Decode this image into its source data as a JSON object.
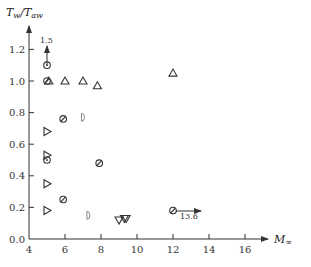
{
  "chart_data": {
    "type": "scatter",
    "title": "",
    "xlabel": "M∞",
    "ylabel": "Tw/Taw",
    "xlim": [
      4,
      17
    ],
    "ylim": [
      0.0,
      1.35
    ],
    "grid": false,
    "legend": null,
    "x_ticks": [
      4,
      6,
      8,
      10,
      12,
      14,
      16
    ],
    "y_ticks": [
      0.0,
      0.2,
      0.4,
      0.6,
      0.8,
      1.0,
      1.2
    ],
    "x_tick_labels": [
      "4",
      "6",
      "8",
      "10",
      "12",
      "14",
      "16"
    ],
    "y_tick_labels": [
      "0.0",
      "0.2",
      "0.4",
      "0.6",
      "0.8",
      "1.0",
      "1.2"
    ],
    "series": [
      {
        "name": "open-circle-dot",
        "marker": "circle-dot",
        "points": [
          [
            5.0,
            1.1
          ],
          [
            5.0,
            0.5
          ]
        ]
      },
      {
        "name": "slashed-circle",
        "marker": "circle-slash",
        "points": [
          [
            5.0,
            1.0
          ],
          [
            5.9,
            0.76
          ],
          [
            7.9,
            0.48
          ],
          [
            5.9,
            0.25
          ],
          [
            12.0,
            0.18
          ]
        ]
      },
      {
        "name": "up-triangle",
        "marker": "triangle-up",
        "points": [
          [
            5.1,
            1.0
          ],
          [
            6.0,
            1.0
          ],
          [
            7.0,
            1.0
          ],
          [
            7.8,
            0.97
          ],
          [
            12.0,
            1.05
          ]
        ]
      },
      {
        "name": "right-triangle",
        "marker": "triangle-right",
        "points": [
          [
            5.0,
            0.68
          ],
          [
            5.0,
            0.53
          ],
          [
            5.0,
            0.35
          ],
          [
            5.0,
            0.18
          ]
        ]
      },
      {
        "name": "half-circle",
        "marker": "d-shape",
        "points": [
          [
            7.0,
            0.77
          ],
          [
            7.3,
            0.15
          ]
        ]
      },
      {
        "name": "down-triangle",
        "marker": "triangle-down",
        "points": [
          [
            9.0,
            0.12
          ],
          [
            9.3,
            0.13
          ],
          [
            9.4,
            0.13
          ]
        ]
      }
    ],
    "annotations": [
      {
        "text": "1.5",
        "at": [
          5.0,
          1.1
        ],
        "note": "upward arrow: point off scale at 1.5"
      },
      {
        "text": "13.6",
        "at": [
          12.0,
          0.18
        ],
        "note": "rightward arrow: range extends to M=13.6"
      }
    ]
  },
  "labels": {
    "ylabel_main": "T",
    "ylabel_sub1": "w",
    "ylabel_slash": "/T",
    "ylabel_sub2": "aw",
    "xlabel_main": "M",
    "xlabel_sub": "∞",
    "annot_up": "1.5",
    "annot_right": "13.6"
  }
}
